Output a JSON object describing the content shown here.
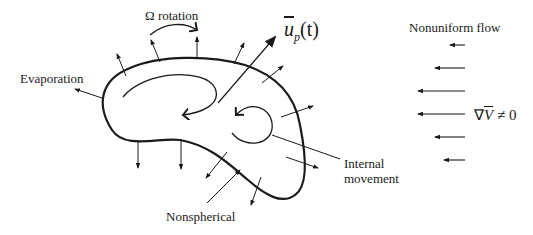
{
  "labels": {
    "rotation": "Ω rotation",
    "evaporation": "Evaporation",
    "velocity_symbol": "u",
    "velocity_subscript": "p",
    "velocity_arg": "(t)",
    "nonuniform_flow": "Nonuniform flow",
    "gradient_nabla": "∇",
    "gradient_V": "V",
    "gradient_neq": "≠ 0",
    "internal_line1": "Internal",
    "internal_line2": "movement",
    "nonspherical": "Nonspherical"
  },
  "colors": {
    "ink": "#1a1a1a",
    "background": "#ffffff"
  },
  "flow_arrows": [
    {
      "y": 45,
      "x_tail": 465,
      "x_head": 450
    },
    {
      "y": 68,
      "x_tail": 465,
      "x_head": 435
    },
    {
      "y": 91,
      "x_tail": 465,
      "x_head": 418
    },
    {
      "y": 114,
      "x_tail": 465,
      "x_head": 418
    },
    {
      "y": 137,
      "x_tail": 465,
      "x_head": 435
    },
    {
      "y": 160,
      "x_tail": 465,
      "x_head": 444
    }
  ]
}
